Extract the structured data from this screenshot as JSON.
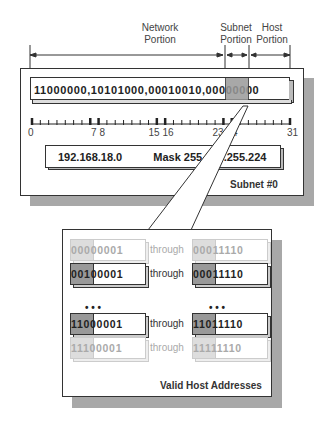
{
  "labels": {
    "network": [
      "Network",
      "Portion"
    ],
    "subnet": [
      "Subnet",
      "Portion"
    ],
    "host": [
      "Host",
      "Portion"
    ]
  },
  "binary_address": "11000000,10101000,00010010,00000000",
  "ticks": [
    "0",
    "7 8",
    "15 16",
    "23 24",
    "31"
  ],
  "address_box": {
    "network": "192.168.18.0",
    "mask": "Mask 255.255.255.224"
  },
  "subnet_caption": "Subnet #0",
  "host_rows": [
    {
      "start_subnet": "000",
      "start_host": "00001",
      "through": "through",
      "end_subnet": "000",
      "end_host": "11110",
      "faded": true
    },
    {
      "start_subnet": "001",
      "start_host": "00001",
      "through": "through",
      "end_subnet": "000",
      "end_host": "11110",
      "faded": false
    },
    {
      "start_subnet": "110",
      "start_host": "00001",
      "through": "through",
      "end_subnet": "110",
      "end_host": "11110",
      "faded": false
    },
    {
      "start_subnet": "111",
      "start_host": "00001",
      "through": "through",
      "end_subnet": "111",
      "end_host": "11110",
      "faded": true
    }
  ],
  "ellipsis": "• • •",
  "host_caption": "Valid Host Addresses",
  "colors": {
    "subnet_shade": "#999999",
    "subnet_shade_faded": "#dddddd",
    "shadow": "#a8a8a8",
    "line": "#333333"
  }
}
